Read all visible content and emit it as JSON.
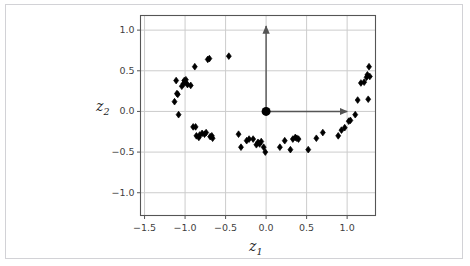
{
  "figure": {
    "background_color": "#ffffff",
    "frame_border_color": "#d2d2d6",
    "axes_border_color": "#555555",
    "grid_color": "#cccccc",
    "marker_color": "#000000",
    "arrow_color": "#555555"
  },
  "chart_data": {
    "type": "scatter",
    "title": "",
    "xlabel": "z1",
    "ylabel": "z2",
    "xlabel_display": "z",
    "xlabel_sub": "1",
    "ylabel_display": "z",
    "ylabel_sub": "2",
    "xlim": [
      -1.55,
      1.35
    ],
    "ylim": [
      -1.28,
      1.18
    ],
    "xticks": [
      -1.5,
      -1.0,
      -0.5,
      0.0,
      0.5,
      1.0
    ],
    "xticklabels": [
      "−1.5",
      "−1.0",
      "−0.5",
      "0.0",
      "0.5",
      "1.0"
    ],
    "yticks": [
      -1.0,
      -0.5,
      0.0,
      0.5,
      1.0
    ],
    "yticklabels": [
      "−1.0",
      "−0.5",
      "0.0",
      "0.5",
      "1.0"
    ],
    "grid": true,
    "legend": null,
    "marker": "diamond",
    "marker_size": 4,
    "origin_marker": {
      "x": 0.0,
      "y": 0.0,
      "size": 9,
      "label": "origin-dot"
    },
    "annotations": [
      {
        "name": "vertical-axis-arrow",
        "from": [
          0.0,
          0.0
        ],
        "to": [
          0.0,
          1.05
        ]
      },
      {
        "name": "horizontal-axis-arrow",
        "from": [
          0.0,
          0.0
        ],
        "to": [
          1.0,
          0.0
        ]
      }
    ],
    "points": [
      [
        -1.13,
        0.12
      ],
      [
        -1.11,
        0.38
      ],
      [
        -1.1,
        0.22
      ],
      [
        -1.09,
        0.21
      ],
      [
        -1.08,
        -0.04
      ],
      [
        -1.04,
        0.31
      ],
      [
        -1.02,
        0.34
      ],
      [
        -1.01,
        0.38
      ],
      [
        -1.0,
        0.36
      ],
      [
        -0.99,
        0.39
      ],
      [
        -0.97,
        0.33
      ],
      [
        -0.93,
        0.32
      ],
      [
        -0.88,
        0.55
      ],
      [
        -0.9,
        -0.19
      ],
      [
        -0.87,
        -0.19
      ],
      [
        -0.86,
        -0.3
      ],
      [
        -0.83,
        -0.32
      ],
      [
        -0.82,
        -0.29
      ],
      [
        -0.79,
        -0.27
      ],
      [
        -0.76,
        -0.28
      ],
      [
        -0.74,
        -0.26
      ],
      [
        -0.72,
        0.64
      ],
      [
        -0.7,
        0.65
      ],
      [
        -0.69,
        -0.31
      ],
      [
        -0.67,
        -0.3
      ],
      [
        -0.66,
        -0.33
      ],
      [
        -0.46,
        0.68
      ],
      [
        -0.34,
        -0.28
      ],
      [
        -0.31,
        -0.44
      ],
      [
        -0.24,
        -0.36
      ],
      [
        -0.21,
        -0.34
      ],
      [
        -0.16,
        -0.34
      ],
      [
        -0.12,
        -0.41
      ],
      [
        -0.1,
        -0.38
      ],
      [
        -0.08,
        -0.4
      ],
      [
        -0.06,
        -0.37
      ],
      [
        -0.03,
        -0.44
      ],
      [
        -0.01,
        -0.5
      ],
      [
        0.17,
        -0.44
      ],
      [
        0.23,
        -0.36
      ],
      [
        0.3,
        -0.47
      ],
      [
        0.33,
        -0.34
      ],
      [
        0.36,
        -0.32
      ],
      [
        0.38,
        -0.33
      ],
      [
        0.4,
        -0.34
      ],
      [
        0.52,
        -0.47
      ],
      [
        0.62,
        -0.33
      ],
      [
        0.7,
        -0.26
      ],
      [
        0.89,
        -0.3
      ],
      [
        0.93,
        -0.23
      ],
      [
        0.97,
        -0.2
      ],
      [
        1.02,
        -0.12
      ],
      [
        1.04,
        -0.11
      ],
      [
        1.1,
        -0.04
      ],
      [
        1.13,
        0.14
      ],
      [
        1.17,
        0.35
      ],
      [
        1.21,
        0.36
      ],
      [
        1.24,
        0.42
      ],
      [
        1.25,
        0.45
      ],
      [
        1.26,
        0.15
      ],
      [
        1.27,
        0.55
      ],
      [
        1.28,
        0.43
      ]
    ]
  }
}
